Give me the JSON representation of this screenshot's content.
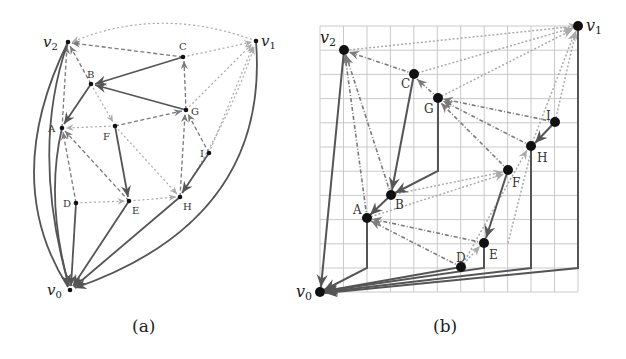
{
  "figure": {
    "captions": {
      "a": "(a)",
      "b": "(b)"
    },
    "colors": {
      "solid_edge": "#555555",
      "dashed_edge": "#7a7a7a",
      "dotted_edge": "#a8a8a8",
      "node": "#111111",
      "grid": "#bdbdbd"
    }
  },
  "panel_a": {
    "caption": "(a)",
    "nodes": [
      {
        "id": "v0",
        "label": "v0",
        "x": 70,
        "y": 290
      },
      {
        "id": "v1",
        "label": "v1",
        "x": 256,
        "y": 41
      },
      {
        "id": "v2",
        "label": "v2",
        "x": 68,
        "y": 42
      },
      {
        "id": "A",
        "label": "A",
        "x": 62,
        "y": 128
      },
      {
        "id": "B",
        "label": "B",
        "x": 91,
        "y": 84
      },
      {
        "id": "C",
        "label": "C",
        "x": 183,
        "y": 57
      },
      {
        "id": "D",
        "label": "D",
        "x": 76,
        "y": 203
      },
      {
        "id": "E",
        "label": "E",
        "x": 129,
        "y": 201
      },
      {
        "id": "F",
        "label": "F",
        "x": 115,
        "y": 126
      },
      {
        "id": "G",
        "label": "G",
        "x": 186,
        "y": 110
      },
      {
        "id": "H",
        "label": "H",
        "x": 180,
        "y": 197
      },
      {
        "id": "I",
        "label": "I",
        "x": 209,
        "y": 153
      }
    ]
  },
  "panel_b": {
    "caption": "(b)",
    "grid": {
      "cols": 11,
      "rows": 11,
      "x0": 320,
      "y0": 292,
      "cell_w": 23.45,
      "cell_h": 24.2
    },
    "nodes": [
      {
        "id": "v0",
        "label": "v0",
        "gx": 0,
        "gy": 0
      },
      {
        "id": "v1",
        "label": "v1",
        "gx": 11,
        "gy": 11
      },
      {
        "id": "v2",
        "label": "v2",
        "gx": 1,
        "gy": 10
      },
      {
        "id": "A",
        "label": "A",
        "gx": 2,
        "gy": 4
      },
      {
        "id": "B",
        "label": "B",
        "gx": 3,
        "gy": 5
      },
      {
        "id": "C",
        "label": "C",
        "gx": 4,
        "gy": 9
      },
      {
        "id": "D",
        "label": "D",
        "gx": 6,
        "gy": 1
      },
      {
        "id": "E",
        "label": "E",
        "gx": 7,
        "gy": 2
      },
      {
        "id": "F",
        "label": "F",
        "gx": 8,
        "gy": 5
      },
      {
        "id": "G",
        "label": "G",
        "gx": 5,
        "gy": 8
      },
      {
        "id": "H",
        "label": "H",
        "gx": 9,
        "gy": 6
      },
      {
        "id": "I",
        "label": "I",
        "gx": 10,
        "gy": 7
      }
    ]
  }
}
